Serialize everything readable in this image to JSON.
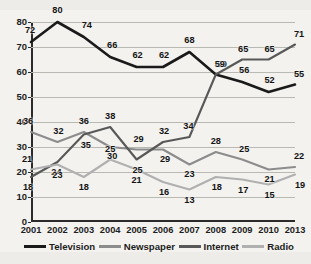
{
  "chart_data": {
    "type": "line",
    "title": "",
    "subtitle": "",
    "xlabel": "",
    "ylabel": "",
    "categories": [
      "2001",
      "2002",
      "2003",
      "2004",
      "2005",
      "2006",
      "2007",
      "2008",
      "2009",
      "2010",
      "2013"
    ],
    "x_tick_labels": [
      "2001",
      "2002",
      "2003",
      "2004",
      "2005",
      "2006",
      "2007",
      "2008",
      "2009",
      "2010",
      "2013"
    ],
    "y_tick_labels": [
      "0",
      "10",
      "20",
      "30",
      "40",
      "50",
      "60",
      "70",
      "80"
    ],
    "y_ticks": [
      0,
      10,
      20,
      30,
      40,
      50,
      60,
      70,
      80
    ],
    "ylim": [
      0,
      80
    ],
    "grid": "horizontal",
    "legend_position": "bottom",
    "data_labels": true,
    "series": [
      {
        "name": "Television",
        "color": "#1a1a1a",
        "values": [
          72,
          80,
          74,
          66,
          62,
          62,
          68,
          59,
          56,
          52,
          55
        ]
      },
      {
        "name": "Newspaper",
        "color": "#8c8c8c",
        "values": [
          36,
          32,
          36,
          30,
          29,
          29,
          23,
          28,
          25,
          21,
          22
        ]
      },
      {
        "name": "Internet",
        "color": "#585858",
        "values": [
          18,
          24,
          35,
          38,
          25,
          32,
          34,
          59,
          65,
          65,
          71
        ]
      },
      {
        "name": "Radio",
        "color": "#b0b0b0",
        "values": [
          21,
          23,
          18,
          25,
          21,
          16,
          13,
          18,
          17,
          15,
          19
        ]
      }
    ]
  },
  "legend": {
    "items": [
      {
        "label": "Television",
        "color": "#1a1a1a"
      },
      {
        "label": "Newspaper",
        "color": "#8c8c8c"
      },
      {
        "label": "Internet",
        "color": "#585858"
      },
      {
        "label": "Radio",
        "color": "#b0b0b0"
      }
    ]
  }
}
